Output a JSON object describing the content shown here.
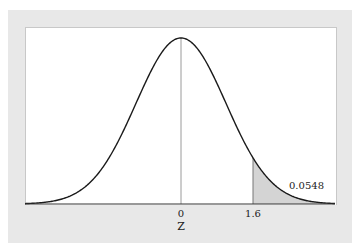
{
  "chart_data": {
    "type": "area",
    "title": "",
    "distribution": "standard normal",
    "xlabel": "Z",
    "ylabel": "",
    "x_ticks": [
      "0",
      "1.6"
    ],
    "shaded_region": {
      "from": 1.6,
      "to": "inf",
      "area": 0.0548
    },
    "annotation": "0.0548",
    "xlim": [
      -3.5,
      3.5
    ],
    "grid": false,
    "colors": {
      "curve": "#1a1a1a",
      "shade": "#d4d4d4",
      "panel": "#e8e8e8",
      "mean_line": "#9a9a9a"
    }
  },
  "labels": {
    "tick_0": "0",
    "tick_1": "1.6",
    "xlabel": "Z",
    "area": "0.0548"
  }
}
